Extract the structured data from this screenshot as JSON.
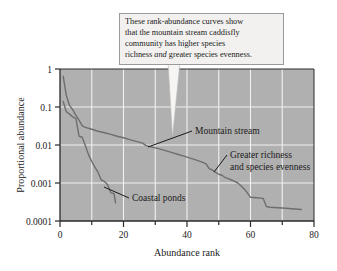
{
  "figure": {
    "callout": {
      "name": "callout-annotation",
      "line1": "These rank-abundance curves show",
      "line2_pre": "that the mountain stream caddisfly",
      "line3": "community has higher species",
      "line4_pre": "richness ",
      "line4_em": "and",
      "line4_post": " greater species evenness."
    },
    "annotations": {
      "mountain_stream": "Mountain stream",
      "coastal_ponds": "Coastal ponds",
      "greater_richness_line1": "Greater richness",
      "greater_richness_line2": "and species evenness"
    },
    "colors": {
      "plot_background": "#b0b0b0",
      "gridline": "#f0f0f0",
      "curve": "#6e6e6e",
      "axis": "#2a2a2a",
      "callout_background": "#f2f1ef",
      "callout_border": "#9a9a9a"
    }
  },
  "chart_data": {
    "type": "line",
    "title": "",
    "xlabel": "Abundance rank",
    "ylabel": "Proportional abundance",
    "xlim": [
      0,
      80
    ],
    "ylim": [
      0.0001,
      1
    ],
    "yscale": "log",
    "grid": true,
    "legend": "none",
    "xticks": [
      0,
      20,
      40,
      60,
      80
    ],
    "xticks_minor": [
      10,
      30,
      50,
      70
    ],
    "ytick_labels": [
      "1",
      "0.1",
      "0.01",
      "0.001",
      "0.0001"
    ],
    "yticks": [
      1,
      0.1,
      0.01,
      0.001,
      0.0001
    ],
    "series": [
      {
        "name": "Mountain stream",
        "x": [
          1,
          2,
          3,
          4,
          5,
          6,
          7,
          8,
          10,
          12,
          14,
          16,
          18,
          20,
          22,
          24,
          26,
          27,
          28,
          29,
          31,
          33,
          35,
          37,
          39,
          41,
          43,
          45,
          46,
          47,
          48,
          49,
          50,
          51,
          52,
          53,
          54,
          55,
          56,
          57,
          58,
          59,
          60,
          62,
          63,
          64,
          65,
          66,
          70,
          73,
          76
        ],
        "y": [
          0.65,
          0.2,
          0.11,
          0.085,
          0.06,
          0.045,
          0.032,
          0.029,
          0.026,
          0.023,
          0.021,
          0.019,
          0.017,
          0.0155,
          0.0138,
          0.0125,
          0.0112,
          0.0098,
          0.0092,
          0.0088,
          0.008,
          0.0072,
          0.0064,
          0.0057,
          0.0051,
          0.0045,
          0.004,
          0.0035,
          0.0032,
          0.0024,
          0.0022,
          0.0019,
          0.0017,
          0.0016,
          0.0014,
          0.0013,
          0.0012,
          0.0011,
          0.001,
          0.00085,
          0.0007,
          0.00055,
          0.00042,
          0.00041,
          0.0004,
          0.00039,
          0.00024,
          0.00023,
          0.00022,
          0.00021,
          0.0002
        ]
      },
      {
        "name": "Coastal ponds",
        "x": [
          1,
          2,
          3,
          4,
          5,
          6,
          7,
          8,
          9,
          10,
          11,
          12,
          13,
          14,
          15,
          16,
          17,
          17.5
        ],
        "y": [
          0.14,
          0.075,
          0.065,
          0.055,
          0.05,
          0.017,
          0.016,
          0.0095,
          0.0055,
          0.0037,
          0.0026,
          0.0019,
          0.0012,
          0.0011,
          0.0009,
          0.00055,
          0.00053,
          0.0003
        ]
      }
    ]
  }
}
